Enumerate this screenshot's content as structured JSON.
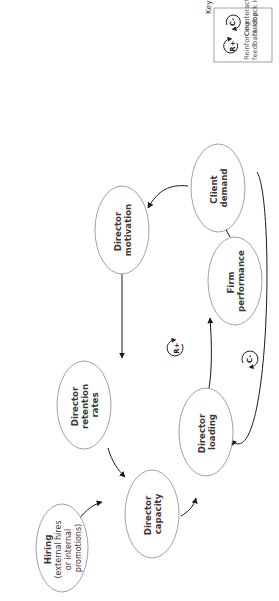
{
  "diagram": {
    "type": "causal-loop-diagram",
    "orientation": "rotated-90-ccw",
    "nodes": [
      {
        "id": "client_demand",
        "lines": [
          "Client",
          "demand"
        ]
      },
      {
        "id": "director_motivation",
        "lines": [
          "Director",
          "motivation"
        ]
      },
      {
        "id": "director_retention",
        "lines": [
          "Director",
          "retention",
          "rates"
        ]
      },
      {
        "id": "director_capacity",
        "lines": [
          "Director",
          "capacity"
        ]
      },
      {
        "id": "director_loading",
        "lines": [
          "Director",
          "loading"
        ]
      },
      {
        "id": "firm_performance",
        "lines": [
          "Firm",
          "performance"
        ]
      },
      {
        "id": "hiring",
        "title": "Hiring",
        "lines": [
          "(external hires",
          "or internal",
          "promotions)"
        ]
      }
    ],
    "edges": [
      {
        "from": "client_demand",
        "to": "director_motivation"
      },
      {
        "from": "director_motivation",
        "to": "director_retention"
      },
      {
        "from": "director_retention",
        "to": "director_capacity"
      },
      {
        "from": "director_capacity",
        "to": "director_loading"
      },
      {
        "from": "director_loading",
        "to": "firm_performance"
      },
      {
        "from": "firm_performance",
        "to": "client_demand"
      },
      {
        "from": "client_demand",
        "to": "director_loading",
        "style": "outer-arc"
      },
      {
        "from": "hiring",
        "to": "director_capacity"
      }
    ],
    "loops": [
      {
        "id": "reinforcing",
        "label": "R+"
      },
      {
        "id": "counteracting",
        "label": "C-"
      }
    ]
  },
  "key": {
    "title": "Key",
    "items": [
      {
        "symbol": "R+",
        "lines": [
          "Reinforcing",
          "feedback loop"
        ]
      },
      {
        "symbol": "C-",
        "lines": [
          "Counteracting",
          "feedback loop"
        ]
      }
    ]
  }
}
